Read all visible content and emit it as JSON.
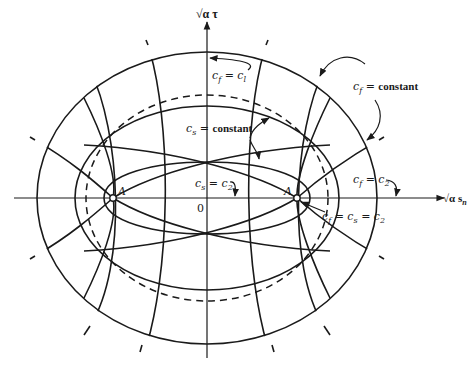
{
  "figure": {
    "axes": {
      "vertical_label": "√α τ",
      "horizontal_label": "√α s",
      "horizontal_label_subscript": "n",
      "origin_label": "0"
    },
    "points": [
      {
        "name": "A",
        "label": "A",
        "position": "left"
      },
      {
        "name": "A",
        "label": "A",
        "position": "right"
      }
    ],
    "annotations": {
      "cf_c1": {
        "var": "c",
        "sub": "f",
        "eq": " = ",
        "rhs": "c",
        "rhs_sub": "l"
      },
      "cf_constant": {
        "var": "c",
        "sub": "f",
        "eq": " = ",
        "rhs": "constant"
      },
      "cs_constant": {
        "var": "c",
        "sub": "s",
        "eq": " = ",
        "rhs": "constant"
      },
      "cs_c2": {
        "var": "c",
        "sub": "s",
        "eq": " = ",
        "rhs": "c",
        "rhs_sub": "2"
      },
      "cf_c2": {
        "var": "c",
        "sub": "f",
        "eq": " = ",
        "rhs": "c",
        "rhs_sub": "2"
      },
      "cf_cs_c2": {
        "var": "c",
        "sub": "f",
        "eq": " = ",
        "mid": "c",
        "mid_sub": "s",
        "eq2": " = ",
        "rhs": "c",
        "rhs_sub": "2"
      }
    },
    "curves": {
      "outer_ellipse": "c_f = c_l (solid)",
      "middle_ellipse": "c_s = constant (solid)",
      "dashed_ellipse": "c_s = c_2 circle (dashed)",
      "inner_ellipse": "c_s = c_2 through points A"
    }
  }
}
